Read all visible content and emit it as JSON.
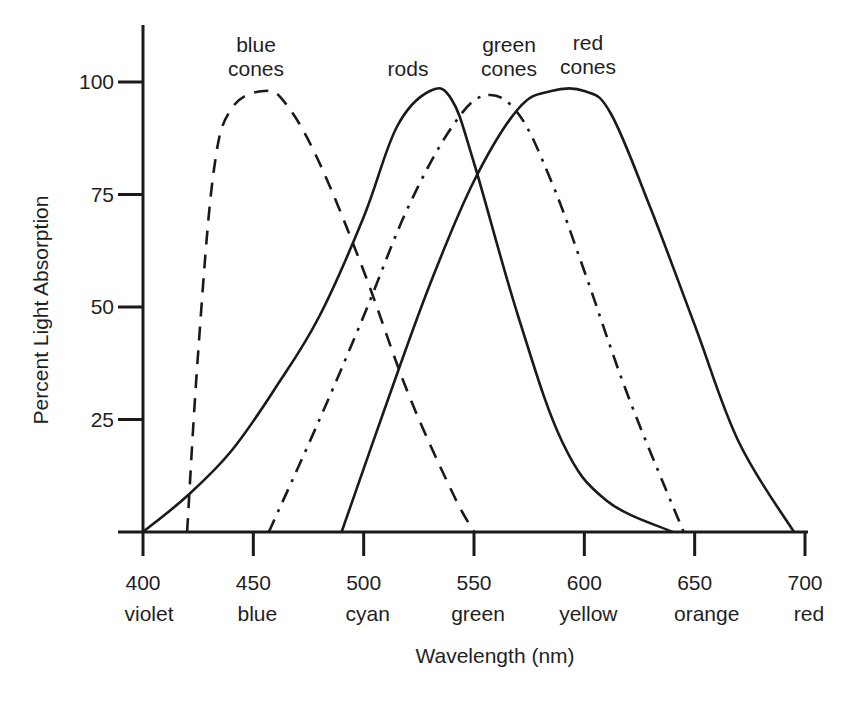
{
  "chart_data": {
    "type": "line",
    "title": "",
    "xlabel": "Wavelength (nm)",
    "ylabel": "Percent Light Absorption",
    "xlim": [
      400,
      700
    ],
    "ylim": [
      0,
      100
    ],
    "grid": false,
    "legend": "inline labels above curve peaks",
    "x_ticks": [
      {
        "value": 400,
        "label": "400",
        "color_name": "violet"
      },
      {
        "value": 450,
        "label": "450",
        "color_name": "blue"
      },
      {
        "value": 500,
        "label": "500",
        "color_name": "cyan"
      },
      {
        "value": 550,
        "label": "550",
        "color_name": "green"
      },
      {
        "value": 600,
        "label": "600",
        "color_name": "yellow"
      },
      {
        "value": 650,
        "label": "650",
        "color_name": "orange"
      },
      {
        "value": 700,
        "label": "700",
        "color_name": "red"
      }
    ],
    "y_ticks": [
      {
        "value": 25,
        "label": "25"
      },
      {
        "value": 50,
        "label": "50"
      },
      {
        "value": 75,
        "label": "75"
      },
      {
        "value": 100,
        "label": "100"
      }
    ],
    "series": [
      {
        "name": "blue cones",
        "label_lines": [
          "blue",
          "cones"
        ],
        "line_style": "dashed",
        "peak_nm": 455,
        "points": [
          [
            420,
            0
          ],
          [
            425,
            40
          ],
          [
            432,
            80
          ],
          [
            440,
            94
          ],
          [
            455,
            98
          ],
          [
            465,
            95
          ],
          [
            480,
            82
          ],
          [
            500,
            58
          ],
          [
            520,
            31
          ],
          [
            540,
            9
          ],
          [
            550,
            0
          ]
        ]
      },
      {
        "name": "rods",
        "label_lines": [
          "rods"
        ],
        "line_style": "solid",
        "peak_nm": 530,
        "points": [
          [
            400,
            0
          ],
          [
            420,
            8
          ],
          [
            440,
            18
          ],
          [
            460,
            32
          ],
          [
            480,
            48
          ],
          [
            500,
            70
          ],
          [
            515,
            90
          ],
          [
            530,
            98
          ],
          [
            540,
            96
          ],
          [
            550,
            82
          ],
          [
            570,
            48
          ],
          [
            590,
            20
          ],
          [
            610,
            7
          ],
          [
            640,
            0
          ]
        ]
      },
      {
        "name": "green cones",
        "label_lines": [
          "green",
          "cones"
        ],
        "line_style": "dash-dot",
        "peak_nm": 555,
        "points": [
          [
            457,
            0
          ],
          [
            480,
            25
          ],
          [
            500,
            48
          ],
          [
            520,
            72
          ],
          [
            540,
            90
          ],
          [
            555,
            97
          ],
          [
            570,
            93
          ],
          [
            585,
            78
          ],
          [
            600,
            58
          ],
          [
            620,
            30
          ],
          [
            645,
            0
          ]
        ]
      },
      {
        "name": "red cones",
        "label_lines": [
          "red",
          "cones"
        ],
        "line_style": "solid",
        "peak_nm": 595,
        "points": [
          [
            490,
            0
          ],
          [
            510,
            28
          ],
          [
            530,
            55
          ],
          [
            550,
            78
          ],
          [
            570,
            94
          ],
          [
            585,
            98
          ],
          [
            600,
            98
          ],
          [
            612,
            93
          ],
          [
            630,
            72
          ],
          [
            650,
            46
          ],
          [
            670,
            20
          ],
          [
            695,
            0
          ]
        ]
      }
    ]
  }
}
